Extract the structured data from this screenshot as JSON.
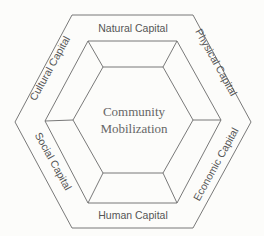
{
  "diagram": {
    "center": {
      "line1": "Community",
      "line2": "Mobilization"
    },
    "capitals": {
      "top": "Natural Capital",
      "top_right": "Physical Capital",
      "bottom_right": "Economic Capital",
      "bottom": "Human Capital",
      "bottom_left": "Social Capital",
      "top_left": "Cultural Capital"
    },
    "colors": {
      "line": "#6a6a6a",
      "text": "#555555",
      "background": "#fcfcfa"
    }
  }
}
